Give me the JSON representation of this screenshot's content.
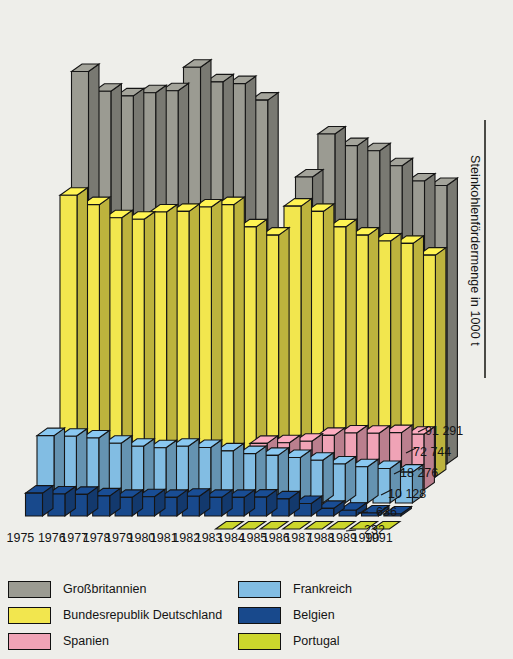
{
  "axis_title": "Steinkohlenfördermenge in 1000 t",
  "legend": {
    "left_items": [
      {
        "label": "Großbritannien",
        "color": "#9b9b92"
      },
      {
        "label": "Bundesrepublik Deutschland",
        "color": "#f2e64e"
      },
      {
        "label": "Spanien",
        "color": "#f0a3b6"
      }
    ],
    "right_items": [
      {
        "label": "Frankreich",
        "color": "#82bde3"
      },
      {
        "label": "Belgien",
        "color": "#18498c"
      },
      {
        "label": "Portugal",
        "color": "#ccd62c"
      }
    ]
  },
  "years": [
    "1975",
    "76",
    "77",
    "78",
    "79",
    "80",
    "81",
    "82",
    "83",
    "84",
    "85",
    "86",
    "87",
    "88",
    "89",
    "90",
    "1991*"
  ],
  "end_values": [
    "91 291",
    "72 744",
    "18 276",
    "10 128",
    "636",
    "232"
  ],
  "chart_data": {
    "type": "bar",
    "subtitle": "",
    "xlabel": "",
    "ylabel": "Steinkohlenfördermenge in 1000 t",
    "categories": [
      "1975",
      "1976",
      "1977",
      "1978",
      "1979",
      "1980",
      "1981",
      "1982",
      "1983",
      "1984",
      "1985",
      "1986",
      "1987",
      "1988",
      "1989",
      "1990",
      "1991"
    ],
    "legend_position": "bottom",
    "grid": false,
    "unit": "1000 t",
    "note": "1991* = vorläufig. Großbritannien 1984 Bergarbeiterstreik (Wert nahe Null, keine Säule gezeichnet).",
    "ylim": [
      0,
      135000
    ],
    "series": [
      {
        "name": "Großbritannien",
        "color": "#9b9b92",
        "final_value": "91 291",
        "values": [
          128700,
          122200,
          120700,
          121700,
          122400,
          130100,
          125300,
          124700,
          119300,
          0,
          94100,
          108200,
          104400,
          102700,
          97800,
          92800,
          91291
        ]
      },
      {
        "name": "Bundesrepublik Deutschland",
        "color": "#f2e64e",
        "final_value": "72 744",
        "values": [
          92400,
          89300,
          85000,
          84500,
          86900,
          87100,
          88500,
          89300,
          82000,
          79300,
          88800,
          87100,
          82000,
          79300,
          77400,
          76600,
          72744
        ]
      },
      {
        "name": "Spanien",
        "color": "#f0a3b6",
        "final_value": "18 276",
        "values": [
          null,
          null,
          null,
          null,
          null,
          null,
          null,
          null,
          null,
          15300,
          15500,
          16000,
          17900,
          18700,
          18600,
          18800,
          18276
        ]
      },
      {
        "name": "Frankreich",
        "color": "#82bde3",
        "final_value": "10 128",
        "values": [
          22100,
          21900,
          21300,
          19600,
          18600,
          18100,
          18600,
          18200,
          17100,
          16200,
          15600,
          14900,
          14000,
          12800,
          11900,
          11300,
          10128
        ]
      },
      {
        "name": "Belgien",
        "color": "#18498c",
        "final_value": "636",
        "values": [
          7500,
          7200,
          7100,
          6600,
          6100,
          6300,
          6100,
          6500,
          6100,
          6100,
          6200,
          5600,
          4100,
          2500,
          1900,
          1000,
          636
        ]
      },
      {
        "name": "Portugal",
        "color": "#ccd62c",
        "final_value": "232",
        "values": [
          null,
          null,
          null,
          null,
          null,
          null,
          null,
          null,
          null,
          230,
          230,
          230,
          230,
          230,
          230,
          230,
          232
        ]
      }
    ]
  }
}
